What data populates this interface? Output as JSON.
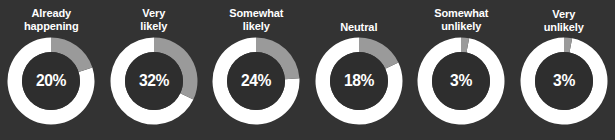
{
  "background_color": "#333333",
  "colors": {
    "background": "#333333",
    "value_arc": "#9a9a9a",
    "remainder_arc": "#ffffff",
    "hole": "#2e2e2e",
    "label_text": "#ffffff",
    "value_text": "#ffffff"
  },
  "chart_data": {
    "type": "pie",
    "title": "",
    "subtitle": "",
    "xlabel": "",
    "ylabel": "",
    "legend": [],
    "units": "%",
    "note": "Six donut gauges; gray arc starts at 12 o'clock and sweeps clockwise by the stated percentage, white arc is the remainder.",
    "categories": [
      "Already happening",
      "Very likely",
      "Somewhat likely",
      "Neutral",
      "Somewhat unlikely",
      "Very unlikely"
    ],
    "values": [
      20,
      32,
      24,
      18,
      3,
      3
    ],
    "series": [
      {
        "name": "Share of respondents",
        "values": [
          20,
          32,
          24,
          18,
          3,
          3
        ]
      }
    ]
  },
  "gauges": [
    {
      "label": "Already\nhappening",
      "label_lines": 2,
      "value": 20,
      "value_text": "20%"
    },
    {
      "label": "Very\nlikely",
      "label_lines": 2,
      "value": 32,
      "value_text": "32%"
    },
    {
      "label": "Somewhat\nlikely",
      "label_lines": 2,
      "value": 24,
      "value_text": "24%"
    },
    {
      "label": "Neutral",
      "label_lines": 1,
      "value": 18,
      "value_text": "18%"
    },
    {
      "label": "Somewhat\nunlikely",
      "label_lines": 2,
      "value": 3,
      "value_text": "3%"
    },
    {
      "label": "Very\nunlikely",
      "label_lines": 1,
      "value": 3,
      "value_text": "3%"
    }
  ]
}
